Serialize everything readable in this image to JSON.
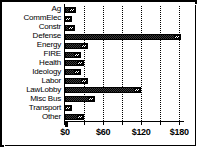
{
  "chart_data": {
    "type": "bar",
    "orientation": "horizontal",
    "title": "",
    "subtitle": "",
    "xlabel": "",
    "ylabel": "",
    "xlim": [
      0,
      186
    ],
    "grid": true,
    "legend": null,
    "legend_position": "none",
    "xtick_labels": [
      "$0",
      "$60",
      "$120",
      "$180"
    ],
    "xtick_values": [
      0,
      60,
      120,
      180
    ],
    "minor_tick_values": [
      0,
      30,
      60,
      90,
      120,
      150,
      180
    ],
    "categories": [
      "Ag",
      "CommElec",
      "Constr",
      "Defense",
      "Energy",
      "FIRE",
      "Health",
      "Ideology",
      "Labor",
      "LawLobby",
      "Misc Bus",
      "Transport",
      "Other"
    ],
    "values": [
      18,
      11,
      16,
      183,
      36,
      25,
      30,
      25,
      36,
      120,
      47,
      11,
      30
    ],
    "value_unit": "$",
    "series": [
      {
        "name": "amount",
        "values": [
          18,
          11,
          16,
          183,
          36,
          25,
          30,
          25,
          36,
          120,
          47,
          11,
          30
        ]
      }
    ]
  },
  "axis": {
    "ticks": [
      {
        "label": "$0",
        "value": 0
      },
      {
        "label": "$60",
        "value": 60
      },
      {
        "label": "$120",
        "value": 120
      },
      {
        "label": "$180",
        "value": 180
      }
    ]
  },
  "colors": {
    "bar_fill": "#111111",
    "bar_cap": "#ffffff",
    "grid": "#000000",
    "axis": "#000000",
    "background": "#ffffff",
    "text": "#000000"
  }
}
